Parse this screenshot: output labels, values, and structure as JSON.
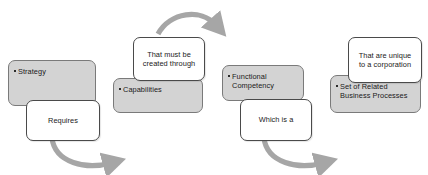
{
  "diagram": {
    "colors": {
      "gray_box_fill": "#d3d3d3",
      "gray_box_border": "#7a7a7a",
      "white_box_fill": "#ffffff",
      "white_box_border": "#4a4a4a",
      "arrow": "#a6a6a6",
      "text": "#1a1a1a",
      "background": "#ffffff"
    },
    "groups": [
      {
        "id": "group-strategy",
        "gray_label": "Strategy",
        "white_label": "Requires"
      },
      {
        "id": "group-capabilities",
        "gray_label": "Capabilities",
        "white_label": "That must be\ncreated through"
      },
      {
        "id": "group-functional-competency",
        "gray_label": "Functional\nCompetency",
        "white_label": "Which is a"
      },
      {
        "id": "group-business-processes",
        "gray_label": "Set of Related\nBusiness Processes",
        "white_label": "That are unique\nto a corporation"
      }
    ],
    "arrows": [
      {
        "id": "arrow-strategy-to-capabilities",
        "direction": "curve-down-right",
        "position": "bottom"
      },
      {
        "id": "arrow-capabilities-to-competency",
        "direction": "curve-over-right",
        "position": "top"
      },
      {
        "id": "arrow-competency-to-processes",
        "direction": "curve-down-right",
        "position": "bottom"
      }
    ]
  }
}
